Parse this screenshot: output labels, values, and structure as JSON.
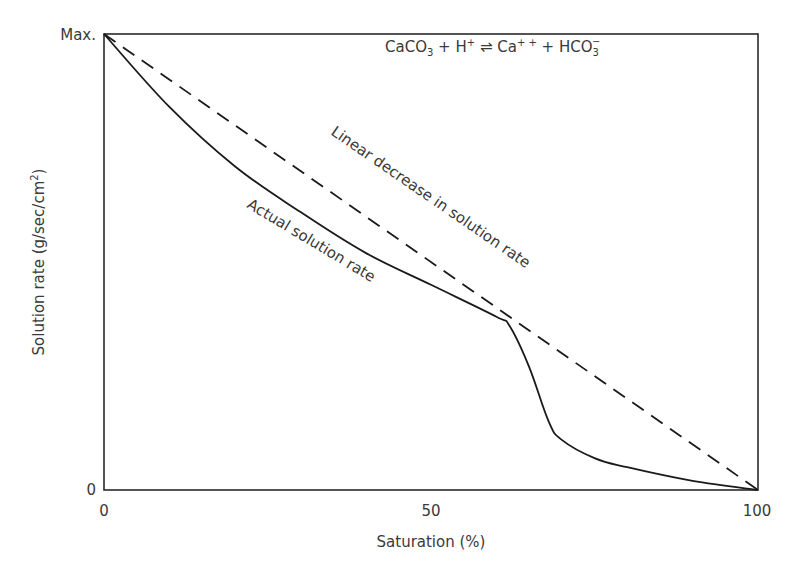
{
  "chart_data": {
    "type": "line",
    "title": "",
    "equation": {
      "parts": [
        "CaCO",
        "3",
        " + H",
        "+",
        " ⇌ Ca",
        "+ +",
        " + HCO",
        "3",
        "−"
      ],
      "text": "CaCO3 + H+ ⇌ Ca++ + HCO3−"
    },
    "xlabel": "Saturation (%)",
    "ylabel": "Solution rate (g/sec/cm²)",
    "ylabel_main": "Solution rate (g/sec/cm",
    "ylabel_sup": "2",
    "ylabel_close": ")",
    "x_ticks": [
      "0",
      "50",
      "100"
    ],
    "y_ticks": [
      "0",
      "Max."
    ],
    "xlim": [
      0,
      100
    ],
    "ylim": [
      0,
      1
    ],
    "grid": false,
    "legend": "none (inline annotations)",
    "series": [
      {
        "name": "Linear decrease in solution rate",
        "style": "dashed",
        "x": [
          0,
          100
        ],
        "y": [
          1.0,
          0.0
        ]
      },
      {
        "name": "Actual solution rate",
        "style": "solid",
        "x": [
          0,
          10,
          20,
          30,
          40,
          50,
          60,
          62,
          65,
          68,
          70,
          75,
          80,
          90,
          100
        ],
        "y": [
          1.0,
          0.84,
          0.71,
          0.61,
          0.52,
          0.45,
          0.38,
          0.36,
          0.27,
          0.15,
          0.11,
          0.07,
          0.05,
          0.02,
          0.0
        ]
      }
    ],
    "annotations": [
      {
        "text": "Linear decrease in solution rate",
        "rotation_deg": 34
      },
      {
        "text": "Actual solution rate",
        "rotation_deg": 30
      }
    ]
  },
  "colors": {
    "line": "#1a1a1a",
    "text": "#3a3a3a",
    "background": "#ffffff"
  }
}
